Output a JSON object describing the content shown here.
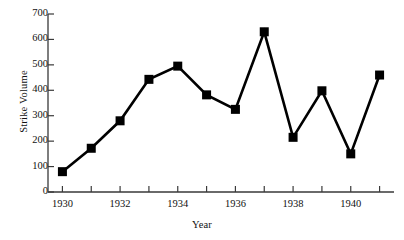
{
  "chart_data": {
    "type": "line",
    "title": "",
    "xlabel": "Year",
    "ylabel": "Strike Volume",
    "x": [
      1930,
      1931,
      1932,
      1933,
      1934,
      1935,
      1936,
      1937,
      1938,
      1939,
      1940,
      1941
    ],
    "values": [
      80,
      172,
      280,
      443,
      495,
      382,
      325,
      630,
      215,
      398,
      150,
      460
    ],
    "series": [
      {
        "name": "Strike Volume",
        "values": [
          80,
          172,
          280,
          443,
          495,
          382,
          325,
          630,
          215,
          398,
          150,
          460
        ]
      }
    ],
    "xlim": [
      1929.5,
      1941.5
    ],
    "ylim": [
      0,
      700
    ],
    "ytick_values": [
      0,
      100,
      200,
      300,
      400,
      500,
      600,
      700
    ],
    "ytick_labels": [
      "0",
      "100",
      "200",
      "300",
      "400",
      "500",
      "600",
      "700"
    ],
    "xtick_values": [
      1930,
      1931,
      1932,
      1933,
      1934,
      1935,
      1936,
      1937,
      1938,
      1939,
      1940,
      1941
    ],
    "xtick_labels_shown": [
      "1930",
      "1932",
      "1934",
      "1936",
      "1938",
      "1940"
    ],
    "xtick_labels_shown_values": [
      1930,
      1932,
      1934,
      1936,
      1938,
      1940
    ],
    "grid": false,
    "legend": null,
    "marker": "square",
    "line_color": "#000000",
    "marker_color": "#000000",
    "background_color": "#ffffff"
  },
  "axis": {
    "y_title": "Strike Volume",
    "x_title": "Year"
  }
}
